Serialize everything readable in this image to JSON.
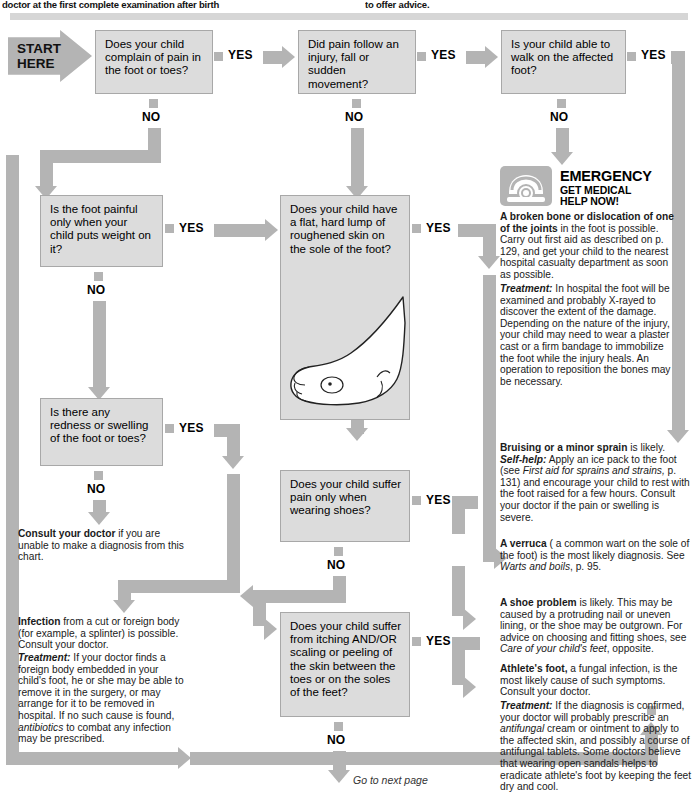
{
  "header": {
    "left_text": "doctor at the first complete examination after birth",
    "right_text": "to offer advice."
  },
  "start": {
    "line1": "START",
    "line2": "HERE"
  },
  "labels": {
    "yes": "YES",
    "no": "NO"
  },
  "questions": [
    {
      "id": "q1",
      "text": "Does your child complain of pain in the foot or toes?"
    },
    {
      "id": "q2",
      "text": "Did pain follow an injury, fall or sudden movement?"
    },
    {
      "id": "q3",
      "text": "Is your child able to walk on the affected foot?"
    },
    {
      "id": "q4",
      "text": "Is the foot painful only when your child puts weight on it?"
    },
    {
      "id": "q5",
      "text": "Does your child have a flat, hard lump of roughened skin on the sole of the foot?"
    },
    {
      "id": "q6",
      "text": "Is there any redness or swelling of the foot or toes?"
    },
    {
      "id": "q7",
      "text": "Does your child suffer pain only when wearing shoes?"
    },
    {
      "id": "q8",
      "text": "Does your child suffer from itching AND/OR scaling or peeling of the skin between the toes or on the soles of the feet?"
    }
  ],
  "emergency": {
    "icon": "telephone-icon",
    "title": "EMERGENCY",
    "subtitle_line1": "GET MEDICAL",
    "subtitle_line2": "HELP NOW!",
    "diagnosis_lead": "A broken bone or dislocation of one of the joints",
    "diagnosis_body": " in the foot is possible. Carry out first aid as described on p. 129, and get your child to the nearest hospital casualty department as soon as possible.",
    "treatment_label": "Treatment:",
    "treatment_body": " In hospital the foot will be examined and probably X-rayed to discover the extent of the damage. Depending on the nature of the injury, your child may need to wear a plaster cast or a firm bandage to immobilize the foot while the injury heals. An operation to reposition the bones may be necessary."
  },
  "advice": {
    "bruising": {
      "lead": "Bruising or a minor sprain",
      "body": " is likely.",
      "selfhelp_label": "Self-help:",
      "selfhelp_body_1": " Apply an ice pack to the foot (see ",
      "selfhelp_italic": "First aid for sprains and strains,",
      "selfhelp_body_2": " p. 131) and encourage your child to rest with the foot raised for a few hours. Consult your doctor if the pain or swelling is severe."
    },
    "verruca": {
      "lead": "A verruca",
      "body_1": " ( a common wart on the sole of the foot) is the most likely diagnosis. See ",
      "italic": "Warts and boils",
      "body_2": ", p. 95."
    },
    "shoe": {
      "lead": "A shoe problem",
      "body_1": " is likely. This may be caused by a protruding nail or uneven lining, or the shoe may be outgrown. For advice on choosing and fitting shoes, see ",
      "italic": "Care of your child's feet",
      "body_2": ", opposite."
    },
    "athletes": {
      "lead": "Athlete's foot,",
      "body": " a fungal infection, is the most likely cause of such symptoms. Consult your doctor.",
      "treatment_label": "Treatment:",
      "treatment_body_1": " If the diagnosis is confirmed, your doctor will probably prescribe an ",
      "treatment_italic": "antifungal",
      "treatment_body_2": " cream or ointment to apply to the affected skin, and possibly a course of antifungal tablets. Some doctors believe that wearing open sandals helps to eradicate athlete's foot by keeping the feet dry and cool."
    },
    "consult": {
      "lead": "Consult your doctor",
      "body": " if you are unable to make a diagnosis from this chart."
    },
    "infection": {
      "lead": "Infection",
      "body": " from a cut or foreign body (for example, a splinter) is possible. Consult your doctor.",
      "treatment_label": "Treatment:",
      "treatment_body_1": " If your doctor finds a foreign body embedded in your child's foot, he or she may be able to remove it in the surgery, or may arrange for it to be removed in hospital. If no such cause is found, ",
      "treatment_italic": "antibiotics",
      "treatment_body_2": " to combat any infection may be prescribed."
    }
  },
  "footer": {
    "next_page": "Go to next page"
  },
  "colors": {
    "flow_gray": "#b4b4b4",
    "box_fill": "#dcdcdc",
    "box_border": "#a8a8a8",
    "rule_gray": "#d6d6d6",
    "text": "#000000"
  }
}
